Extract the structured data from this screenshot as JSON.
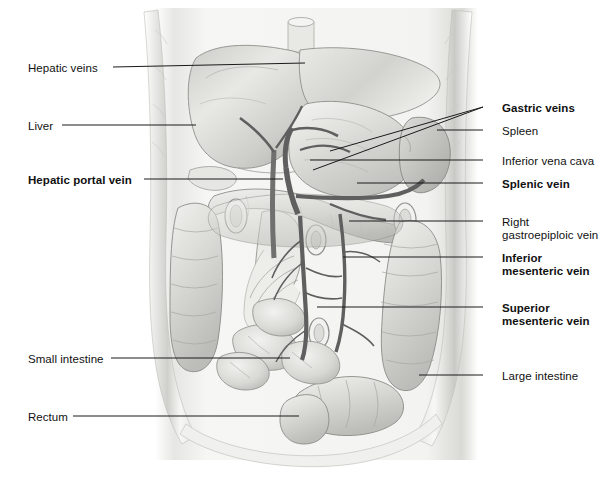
{
  "figure": {
    "style": "grayscale pencil-and-wash anatomical illustration",
    "view": "anterior view of abdominal cavity with body wall removed"
  },
  "labels_left": [
    {
      "id": "hepatic-veins",
      "text": "Hepatic veins",
      "bold": false,
      "x": 28,
      "y": 62,
      "line": [
        113,
        67,
        305,
        63
      ]
    },
    {
      "id": "liver",
      "text": "Liver",
      "bold": false,
      "x": 28,
      "y": 120,
      "line": [
        62,
        125,
        196,
        125
      ]
    },
    {
      "id": "hepatic-portal-vein",
      "text": "Hepatic portal vein",
      "bold": true,
      "x": 28,
      "y": 174,
      "line": [
        144,
        179,
        283,
        179
      ]
    },
    {
      "id": "small-intestine",
      "text": "Small intestine",
      "bold": false,
      "x": 28,
      "y": 353,
      "line": [
        111,
        358,
        290,
        358
      ]
    },
    {
      "id": "rectum",
      "text": "Rectum",
      "bold": false,
      "x": 28,
      "y": 411,
      "line": [
        73,
        416,
        299,
        416
      ]
    }
  ],
  "labels_right": [
    {
      "id": "gastric-veins",
      "text": "Gastric veins",
      "bold": true,
      "x": 502,
      "y": 102,
      "lines": [
        [
          483,
          107,
          330,
          151
        ],
        [
          483,
          107,
          313,
          170
        ]
      ]
    },
    {
      "id": "spleen",
      "text": "Spleen",
      "bold": false,
      "x": 502,
      "y": 125,
      "lines": [
        [
          483,
          130,
          437,
          130
        ]
      ]
    },
    {
      "id": "inferior-vena-cava",
      "text": "Inferior vena cava",
      "bold": false,
      "x": 502,
      "y": 155,
      "lines": [
        [
          483,
          160,
          310,
          160
        ]
      ]
    },
    {
      "id": "splenic-vein",
      "text": "Splenic vein",
      "bold": true,
      "x": 502,
      "y": 178,
      "lines": [
        [
          483,
          183,
          357,
          183
        ]
      ]
    },
    {
      "id": "right-gastroepiploic",
      "text": "Right\ngastroepiploic vein",
      "bold": false,
      "x": 502,
      "y": 216,
      "lines": [
        [
          483,
          221,
          349,
          221
        ]
      ]
    },
    {
      "id": "inferior-mesenteric",
      "text": "Inferior\nmesenteric vein",
      "bold": true,
      "x": 502,
      "y": 252,
      "lines": [
        [
          483,
          257,
          343,
          257
        ]
      ]
    },
    {
      "id": "superior-mesenteric",
      "text": "Superior\nmesenteric vein",
      "bold": true,
      "x": 502,
      "y": 302,
      "lines": [
        [
          483,
          307,
          317,
          307
        ]
      ]
    },
    {
      "id": "large-intestine",
      "text": "Large intestine",
      "bold": false,
      "x": 502,
      "y": 370,
      "lines": [
        [
          483,
          375,
          419,
          375
        ]
      ]
    }
  ],
  "colors": {
    "ink": "#1a1a1a",
    "background": "#ffffff",
    "wash_light": "#f2f2f0",
    "wash_mid": "#d9d9d6",
    "wash_dark": "#a8a8a4",
    "vessel": "#6f6f70"
  }
}
